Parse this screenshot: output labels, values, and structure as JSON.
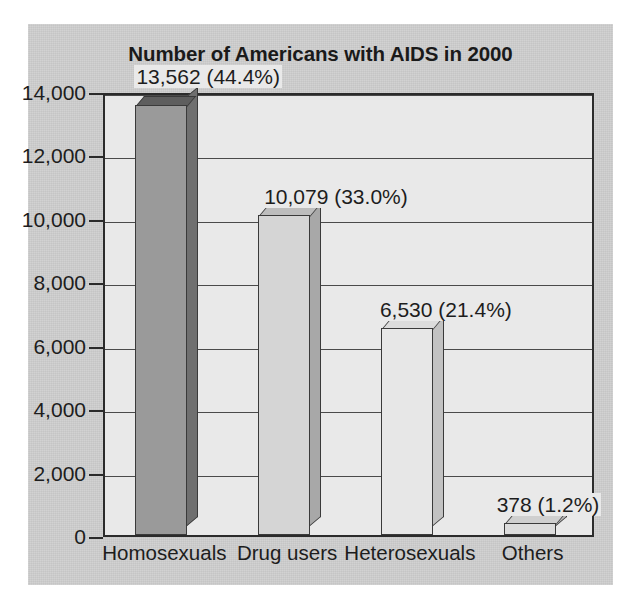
{
  "chart_data": {
    "type": "bar",
    "title": "Number of Americans with AIDS in 2000",
    "xlabel": "",
    "ylabel": "",
    "categories": [
      "Homosexuals",
      "Drug users",
      "Heterosexuals",
      "Others"
    ],
    "values": [
      13562,
      10079,
      6530,
      378
    ],
    "value_labels": [
      "13,562 (44.4%)",
      "10,079 (33.0%)",
      "6,530 (21.4%)",
      "378 (1.2%)"
    ],
    "percentages": [
      44.4,
      33.0,
      21.4,
      1.2
    ],
    "ylim": [
      0,
      14000
    ],
    "ytick_values": [
      0,
      2000,
      4000,
      6000,
      8000,
      10000,
      12000,
      14000
    ],
    "ytick_labels": [
      "0",
      "2,000",
      "4,000",
      "6,000",
      "8,000",
      "10,000",
      "12,000",
      "14,000"
    ],
    "grid": true,
    "grid_axis": "y",
    "legend": false,
    "style": "3d-bar",
    "bar_colors": [
      "#9a9a9a",
      "#d5d5d5",
      "#e7e7e7",
      "#dcdcdc"
    ],
    "bar_side_colors": [
      "#6f6f6f",
      "#a8a8a8",
      "#c2c2c2",
      "#b8b8b8"
    ],
    "bar_top_colors": [
      "#5e5e5e",
      "#bdbdbd",
      "#dcdcdc",
      "#cfcfcf"
    ],
    "plot_background": "#e9e9e9",
    "figure_background": "#cfcfcf",
    "axis_color": "#2b2b2b",
    "text_color": "#1d1d1d"
  }
}
